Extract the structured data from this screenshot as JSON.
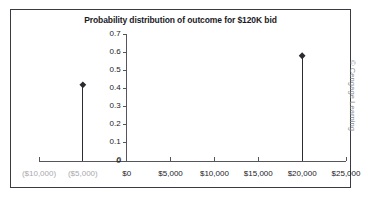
{
  "figure": {
    "copyright": "© Cengage Learning",
    "frame_color": "#3a3a42",
    "background": "#ffffff"
  },
  "chart_data": {
    "type": "scatter",
    "title": "Probability distribution of outcome for $120K bid",
    "xlabel": "",
    "ylabel": "",
    "x": [
      -5000,
      20000
    ],
    "values": [
      0.42,
      0.58
    ],
    "point_labels": [
      "($5,000)",
      "$20,000"
    ],
    "xlim": [
      -10000,
      25000
    ],
    "ylim": [
      0,
      0.7
    ],
    "x_tick_values": [
      -10000,
      -5000,
      0,
      5000,
      10000,
      15000,
      20000,
      25000
    ],
    "x_tick_labels": [
      "($10,000)",
      "($5,000)",
      "$0",
      "$5,000",
      "$10,000",
      "$15,000",
      "$20,000",
      "$25,000"
    ],
    "x_tick_muted": [
      true,
      true,
      false,
      false,
      false,
      false,
      false,
      false
    ],
    "y_tick_values": [
      0,
      0.1,
      0.2,
      0.3,
      0.4,
      0.5,
      0.6,
      0.7
    ],
    "y_tick_labels": [
      "0",
      "0.1",
      "0.2",
      "0.3",
      "0.4",
      "0.5",
      "0.6",
      "0.7"
    ],
    "origin_label": "0",
    "grid": false,
    "legend": false,
    "marker": "diamond",
    "marker_color": "#2b2b30",
    "stem_color": "#2b2b30",
    "axis_color": "#55555c"
  }
}
